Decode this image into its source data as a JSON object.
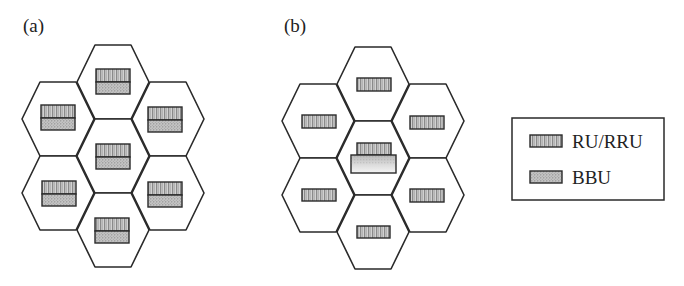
{
  "panels": [
    {
      "label": "(a)",
      "description": "Distributed RAN: each cell has co-located RU and BBU",
      "cells": [
        {
          "position": "top",
          "units": [
            "RU",
            "BBU"
          ]
        },
        {
          "position": "upper-left",
          "units": [
            "RU",
            "BBU"
          ]
        },
        {
          "position": "upper-right",
          "units": [
            "RU",
            "BBU"
          ]
        },
        {
          "position": "center",
          "units": [
            "RU",
            "BBU"
          ]
        },
        {
          "position": "lower-left",
          "units": [
            "RU",
            "BBU"
          ]
        },
        {
          "position": "lower-right",
          "units": [
            "RU",
            "BBU"
          ]
        },
        {
          "position": "bottom",
          "units": [
            "RU",
            "BBU"
          ]
        }
      ]
    },
    {
      "label": "(b)",
      "description": "Centralized RAN: RRU in each cell, BBU pool in center cell",
      "cells": [
        {
          "position": "top",
          "units": [
            "RRU"
          ]
        },
        {
          "position": "upper-left",
          "units": [
            "RRU"
          ]
        },
        {
          "position": "upper-right",
          "units": [
            "RRU"
          ]
        },
        {
          "position": "center",
          "units": [
            "RRU",
            "BBU-pool"
          ]
        },
        {
          "position": "lower-left",
          "units": [
            "RRU"
          ]
        },
        {
          "position": "lower-right",
          "units": [
            "RRU"
          ]
        },
        {
          "position": "bottom",
          "units": [
            "RRU"
          ]
        }
      ]
    }
  ],
  "legend": {
    "items": [
      {
        "label": "RU/RRU",
        "swatch": "vertical-stripe-pattern"
      },
      {
        "label": "BBU",
        "swatch": "dotted-pattern"
      }
    ]
  },
  "colors": {
    "stroke": "#2a2a2a",
    "ru_fill_base": "#c8c8c8",
    "bbu_fill_base": "#bdbdbd",
    "background": "#ffffff"
  }
}
